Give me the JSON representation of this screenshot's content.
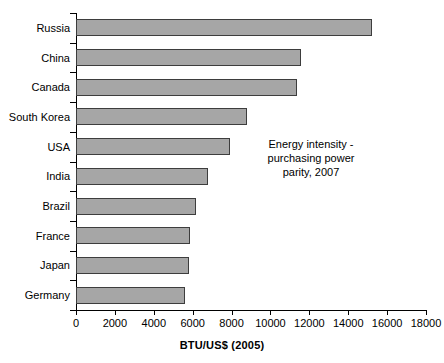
{
  "chart_data": {
    "type": "bar",
    "orientation": "horizontal",
    "title": "",
    "xlabel": "BTU/US$ (2005)",
    "ylabel": "",
    "xlim": [
      0,
      18000
    ],
    "xticks": [
      0,
      2000,
      4000,
      6000,
      8000,
      10000,
      12000,
      14000,
      16000,
      18000
    ],
    "xtick_labels": [
      "0",
      "2000",
      "4000",
      "6000",
      "8000",
      "10000",
      "12000",
      "14000",
      "16000",
      "18000"
    ],
    "grid": false,
    "legend": null,
    "categories": [
      "Russia",
      "China",
      "Canada",
      "South Korea",
      "USA",
      "India",
      "Brazil",
      "France",
      "Japan",
      "Germany"
    ],
    "values": [
      15200,
      11550,
      11350,
      8800,
      7900,
      6800,
      6150,
      5850,
      5800,
      5600
    ],
    "annotations": [
      {
        "text_lines": [
          "Energy intensity -",
          "purchasing power",
          "parity, 2007"
        ],
        "position": "inside-right-middle"
      }
    ],
    "colors": {
      "bar_fill": "#a6a6a6",
      "bar_edge": "#3d3d3d",
      "axis": "#000000",
      "text": "#000000",
      "background": "#ffffff"
    }
  }
}
